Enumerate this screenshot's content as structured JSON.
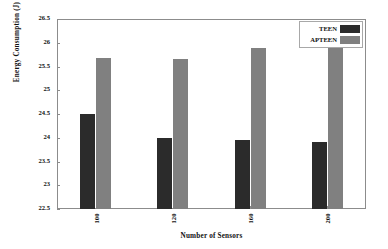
{
  "chart_data": {
    "type": "bar",
    "title": "",
    "xlabel": "Number of Sensors",
    "ylabel": "Energy Consumption (J)",
    "categories": [
      "100",
      "120",
      "160",
      "200"
    ],
    "series": [
      {
        "name": "TEEN",
        "color": "#2b2b2b",
        "values": [
          24.5,
          24.0,
          23.96,
          23.91
        ]
      },
      {
        "name": "APTEEN",
        "color": "#808080",
        "values": [
          25.67,
          25.65,
          25.89,
          25.94
        ]
      }
    ],
    "ylim": [
      22.5,
      26.5
    ],
    "ytick_step": 0.5,
    "yticks": [
      "26.5",
      "26",
      "25.5",
      "25",
      "24.5",
      "24",
      "23.5",
      "23",
      "22.5"
    ],
    "grid": false,
    "legend_position": "top-right",
    "legend_entries": [
      "TEEN",
      "APTEEN"
    ],
    "xtick_rotation": -90
  }
}
